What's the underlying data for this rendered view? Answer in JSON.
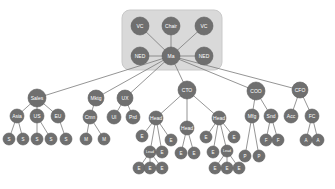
{
  "diagram": {
    "type": "org-chart",
    "colors": {
      "node_fill": "#6f6f6f",
      "edge": "#7a7a7a",
      "board_box": "#d9d9d9",
      "label": "#ffffff"
    },
    "board_box": {
      "x": 122,
      "y": 10,
      "w": 100,
      "h": 60,
      "rx": 8
    },
    "nodes": [
      {
        "id": "vc1",
        "label": "VC",
        "x": 140,
        "y": 26,
        "r": 9
      },
      {
        "id": "chair",
        "label": "Chair",
        "x": 171,
        "y": 26,
        "r": 9
      },
      {
        "id": "vc2",
        "label": "VC",
        "x": 204,
        "y": 26,
        "r": 9
      },
      {
        "id": "ned1",
        "label": "NED",
        "x": 140,
        "y": 56,
        "r": 9
      },
      {
        "id": "ma",
        "label": "Ma",
        "x": 171,
        "y": 56,
        "r": 9
      },
      {
        "id": "ned2",
        "label": "NED",
        "x": 204,
        "y": 56,
        "r": 9
      },
      {
        "id": "sales",
        "label": "Sales",
        "x": 37,
        "y": 98,
        "r": 9
      },
      {
        "id": "mktg",
        "label": "Mktg",
        "x": 96,
        "y": 98,
        "r": 8
      },
      {
        "id": "ux",
        "label": "UX",
        "x": 125,
        "y": 98,
        "r": 8
      },
      {
        "id": "cto",
        "label": "CTO",
        "x": 187,
        "y": 90,
        "r": 9
      },
      {
        "id": "coo",
        "label": "COO",
        "x": 256,
        "y": 91,
        "r": 9
      },
      {
        "id": "cfo",
        "label": "CFO",
        "x": 300,
        "y": 90,
        "r": 8
      },
      {
        "id": "asia",
        "label": "Asia",
        "x": 17,
        "y": 116,
        "r": 7
      },
      {
        "id": "us",
        "label": "US",
        "x": 37,
        "y": 116,
        "r": 7
      },
      {
        "id": "eu",
        "label": "EU",
        "x": 58,
        "y": 116,
        "r": 7
      },
      {
        "id": "cmn",
        "label": "Cmn",
        "x": 90,
        "y": 117,
        "r": 7
      },
      {
        "id": "ui",
        "label": "UI",
        "x": 114,
        "y": 117,
        "r": 7
      },
      {
        "id": "prd",
        "label": "Prd",
        "x": 133,
        "y": 117,
        "r": 7
      },
      {
        "id": "head1",
        "label": "Head",
        "x": 156,
        "y": 118,
        "r": 7
      },
      {
        "id": "head2",
        "label": "Head",
        "x": 187,
        "y": 128,
        "r": 7
      },
      {
        "id": "head3",
        "label": "Head",
        "x": 219,
        "y": 118,
        "r": 7
      },
      {
        "id": "mfg",
        "label": "Mfg",
        "x": 252,
        "y": 116,
        "r": 7
      },
      {
        "id": "snd",
        "label": "Snd",
        "x": 271,
        "y": 116,
        "r": 7
      },
      {
        "id": "acc",
        "label": "Acc",
        "x": 291,
        "y": 116,
        "r": 7
      },
      {
        "id": "fc",
        "label": "FC",
        "x": 312,
        "y": 116,
        "r": 7
      },
      {
        "id": "s1",
        "label": "S",
        "x": 9,
        "y": 139,
        "r": 6
      },
      {
        "id": "s2",
        "label": "S",
        "x": 23,
        "y": 139,
        "r": 6
      },
      {
        "id": "s3",
        "label": "S",
        "x": 37,
        "y": 139,
        "r": 6
      },
      {
        "id": "s4",
        "label": "S",
        "x": 51,
        "y": 139,
        "r": 6
      },
      {
        "id": "s5",
        "label": "S",
        "x": 66,
        "y": 139,
        "r": 6
      },
      {
        "id": "m1",
        "label": "M",
        "x": 86,
        "y": 139,
        "r": 6
      },
      {
        "id": "m2",
        "label": "M",
        "x": 104,
        "y": 139,
        "r": 6
      },
      {
        "id": "e1",
        "label": "E",
        "x": 142,
        "y": 136,
        "r": 6
      },
      {
        "id": "lead1",
        "label": "Lead",
        "x": 150,
        "y": 152,
        "r": 6
      },
      {
        "id": "e2",
        "label": "E",
        "x": 162,
        "y": 152,
        "r": 6
      },
      {
        "id": "e3",
        "label": "E",
        "x": 171,
        "y": 140,
        "r": 6
      },
      {
        "id": "e4",
        "label": "E",
        "x": 139,
        "y": 168,
        "r": 6
      },
      {
        "id": "e5",
        "label": "E",
        "x": 150,
        "y": 168,
        "r": 6
      },
      {
        "id": "e6",
        "label": "E",
        "x": 162,
        "y": 168,
        "r": 6
      },
      {
        "id": "e7",
        "label": "E",
        "x": 181,
        "y": 153,
        "r": 6
      },
      {
        "id": "e8",
        "label": "E",
        "x": 194,
        "y": 153,
        "r": 6
      },
      {
        "id": "e9",
        "label": "E",
        "x": 206,
        "y": 137,
        "r": 6
      },
      {
        "id": "e10",
        "label": "E",
        "x": 213,
        "y": 152,
        "r": 6
      },
      {
        "id": "lead2",
        "label": "Lead",
        "x": 227,
        "y": 151,
        "r": 6
      },
      {
        "id": "e11",
        "label": "E",
        "x": 234,
        "y": 137,
        "r": 6
      },
      {
        "id": "e12",
        "label": "E",
        "x": 215,
        "y": 168,
        "r": 6
      },
      {
        "id": "e13",
        "label": "E",
        "x": 227,
        "y": 168,
        "r": 6
      },
      {
        "id": "e14",
        "label": "E",
        "x": 239,
        "y": 168,
        "r": 6
      },
      {
        "id": "p1",
        "label": "P",
        "x": 245,
        "y": 156,
        "r": 6
      },
      {
        "id": "p2",
        "label": "P",
        "x": 259,
        "y": 156,
        "r": 6
      },
      {
        "id": "f1",
        "label": "F",
        "x": 266,
        "y": 140,
        "r": 6
      },
      {
        "id": "f2",
        "label": "F",
        "x": 278,
        "y": 140,
        "r": 6
      },
      {
        "id": "a1",
        "label": "A",
        "x": 306,
        "y": 140,
        "r": 6
      },
      {
        "id": "a2",
        "label": "A",
        "x": 318,
        "y": 140,
        "r": 6
      }
    ],
    "edges": [
      [
        "ma",
        "vc1"
      ],
      [
        "ma",
        "chair"
      ],
      [
        "ma",
        "vc2"
      ],
      [
        "ma",
        "ned1"
      ],
      [
        "ma",
        "ned2"
      ],
      [
        "ma",
        "sales"
      ],
      [
        "ma",
        "mktg"
      ],
      [
        "ma",
        "ux"
      ],
      [
        "ma",
        "cto"
      ],
      [
        "ma",
        "coo"
      ],
      [
        "ma",
        "cfo"
      ],
      [
        "sales",
        "asia"
      ],
      [
        "sales",
        "us"
      ],
      [
        "sales",
        "eu"
      ],
      [
        "asia",
        "s1"
      ],
      [
        "asia",
        "s2"
      ],
      [
        "us",
        "s3"
      ],
      [
        "us",
        "s4"
      ],
      [
        "eu",
        "s5"
      ],
      [
        "mktg",
        "cmn"
      ],
      [
        "cmn",
        "m1"
      ],
      [
        "cmn",
        "m2"
      ],
      [
        "ux",
        "ui"
      ],
      [
        "ux",
        "prd"
      ],
      [
        "cto",
        "head1"
      ],
      [
        "cto",
        "head2"
      ],
      [
        "cto",
        "head3"
      ],
      [
        "head1",
        "e1"
      ],
      [
        "head1",
        "lead1"
      ],
      [
        "head1",
        "e2"
      ],
      [
        "head1",
        "e3"
      ],
      [
        "lead1",
        "e4"
      ],
      [
        "lead1",
        "e5"
      ],
      [
        "lead1",
        "e6"
      ],
      [
        "head2",
        "e7"
      ],
      [
        "head2",
        "e8"
      ],
      [
        "head3",
        "e9"
      ],
      [
        "head3",
        "e10"
      ],
      [
        "head3",
        "lead2"
      ],
      [
        "head3",
        "e11"
      ],
      [
        "lead2",
        "e12"
      ],
      [
        "lead2",
        "e13"
      ],
      [
        "lead2",
        "e14"
      ],
      [
        "coo",
        "mfg"
      ],
      [
        "coo",
        "snd"
      ],
      [
        "mfg",
        "p1"
      ],
      [
        "mfg",
        "p2"
      ],
      [
        "snd",
        "f1"
      ],
      [
        "snd",
        "f2"
      ],
      [
        "cfo",
        "acc"
      ],
      [
        "cfo",
        "fc"
      ],
      [
        "fc",
        "a1"
      ],
      [
        "fc",
        "a2"
      ]
    ]
  }
}
